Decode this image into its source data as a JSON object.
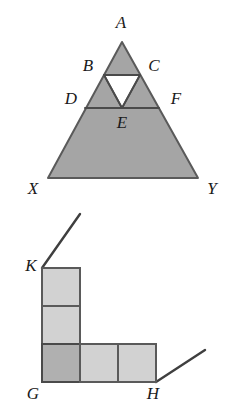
{
  "figure": {
    "colors": {
      "stroke": "#5a5a5a",
      "stroke_dark": "#4a4a4a",
      "triangle_fill": "#a5a5a5",
      "inner_triangle_fill": "#ffffff",
      "square_fill": "#d2d2d2",
      "corner_square_fill": "#b0b0b0",
      "label_color": "#1a1a1a",
      "background": "#ffffff"
    },
    "top_figure": {
      "name": "subdivided-triangle",
      "description": "Triangle A X Y subdivided by horizontal segments B C and D F with an inverted unshaded triangle between them",
      "outer_triangle": {
        "apex": {
          "label": "A",
          "x": 122,
          "y": 42
        },
        "left_base": {
          "label": "X",
          "x": 48,
          "y": 178
        },
        "right_base": {
          "label": "Y",
          "x": 198,
          "y": 178
        }
      },
      "segment_bc": {
        "left": {
          "label": "B",
          "x": 104,
          "y": 75
        },
        "right": {
          "label": "C",
          "x": 140,
          "y": 75
        }
      },
      "segment_df": {
        "left": {
          "label": "D",
          "x": 85,
          "y": 108
        },
        "right": {
          "label": "F",
          "x": 159,
          "y": 108
        }
      },
      "inverted_triangle": {
        "left": {
          "x": 104,
          "y": 75
        },
        "right": {
          "x": 140,
          "y": 75
        },
        "bottom": {
          "x": 122,
          "y": 108
        }
      },
      "labels": [
        {
          "text": "A",
          "x": 121,
          "y": 22
        },
        {
          "text": "B",
          "x": 88,
          "y": 65
        },
        {
          "text": "C",
          "x": 154,
          "y": 65
        },
        {
          "text": "D",
          "x": 71,
          "y": 98
        },
        {
          "text": "F",
          "x": 176,
          "y": 98
        },
        {
          "text": "E",
          "x": 122,
          "y": 122
        },
        {
          "text": "X",
          "x": 33,
          "y": 188
        },
        {
          "text": "Y",
          "x": 212,
          "y": 188
        }
      ]
    },
    "bottom_figure": {
      "name": "l-shaped-polyomino",
      "description": "L-shaped figure of unit squares with vertices K (top of vertical arm), G (corner), H (end of horizontal arm) and two rays extending outward",
      "unit": 38,
      "origin": {
        "x": 42,
        "y": 382
      },
      "squares": [
        {
          "name": "square-vertical-top",
          "col": 0,
          "row": 2,
          "shade": "light"
        },
        {
          "name": "square-vertical-middle",
          "col": 0,
          "row": 1,
          "shade": "light"
        },
        {
          "name": "square-corner",
          "col": 0,
          "row": 0,
          "shade": "dark"
        },
        {
          "name": "square-horizontal-middle",
          "col": 1,
          "row": 0,
          "shade": "light"
        },
        {
          "name": "square-horizontal-right",
          "col": 2,
          "row": 0,
          "shade": "light"
        }
      ],
      "rays": [
        {
          "name": "ray-from-k",
          "x1": 42,
          "y1": 268,
          "x2": 80,
          "y2": 214
        },
        {
          "name": "ray-from-h",
          "x1": 156,
          "y1": 382,
          "x2": 205,
          "y2": 350
        }
      ],
      "labels": [
        {
          "text": "K",
          "x": 31,
          "y": 265
        },
        {
          "text": "G",
          "x": 33,
          "y": 393
        },
        {
          "text": "H",
          "x": 153,
          "y": 393
        }
      ]
    }
  }
}
